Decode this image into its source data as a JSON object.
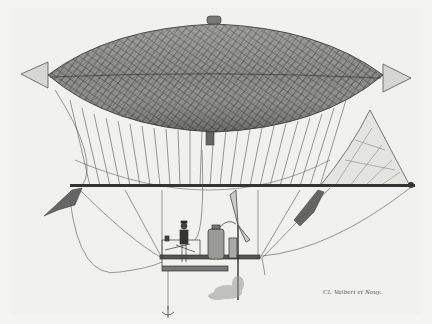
{
  "image": {
    "subject": "Engraving of a steam-powered dirigible airship with netted envelope, suspended gondola with pilot and steam engine, propeller and triangular rudder",
    "caption": "Cl. Vaibert et Nouy.",
    "colors": {
      "paper": "#f1f1ef",
      "ink": "#2a2a2a",
      "envelope": "#8a8a8a",
      "envelope_dark": "#5a5a5a"
    }
  }
}
